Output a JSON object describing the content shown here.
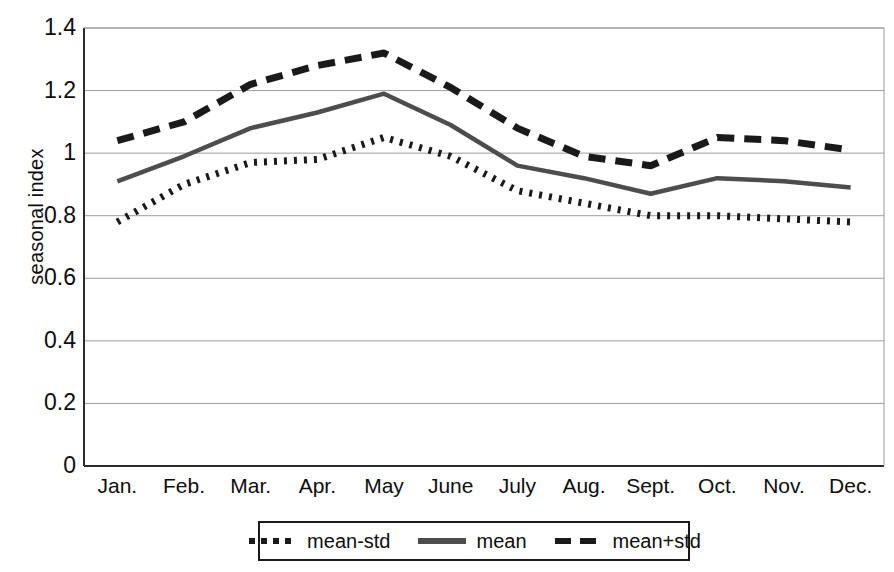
{
  "chart_data": {
    "type": "line",
    "title": "",
    "xlabel": "",
    "ylabel": "seasonal index",
    "categories": [
      "Jan.",
      "Feb.",
      "Mar.",
      "Apr.",
      "May",
      "June",
      "July",
      "Aug.",
      "Sept.",
      "Oct.",
      "Nov.",
      "Dec."
    ],
    "ylim": [
      0,
      1.4
    ],
    "yticks": [
      "0",
      "0.2",
      "0.4",
      "0.6",
      "0.8",
      "1",
      "1.2",
      "1.4"
    ],
    "ytick_values": [
      0,
      0.2,
      0.4,
      0.6,
      0.8,
      1.0,
      1.2,
      1.4
    ],
    "grid": true,
    "grid_axis": "y",
    "legend_position": "bottom",
    "series": [
      {
        "name": "mean-std",
        "style": "dotted",
        "color": "#1a1a1a",
        "values": [
          0.78,
          0.9,
          0.97,
          0.98,
          1.05,
          0.99,
          0.88,
          0.84,
          0.8,
          0.8,
          0.79,
          0.78
        ]
      },
      {
        "name": "mean",
        "style": "solid",
        "color": "#4d4d4d",
        "values": [
          0.91,
          0.99,
          1.08,
          1.13,
          1.19,
          1.09,
          0.96,
          0.92,
          0.87,
          0.92,
          0.91,
          0.89
        ]
      },
      {
        "name": "mean+std",
        "style": "dashed",
        "color": "#1a1a1a",
        "values": [
          1.04,
          1.1,
          1.22,
          1.28,
          1.32,
          1.21,
          1.08,
          0.99,
          0.96,
          1.05,
          1.04,
          1.01
        ]
      }
    ]
  },
  "legend": {
    "items": [
      {
        "label": "mean-std"
      },
      {
        "label": "mean"
      },
      {
        "label": "mean+std"
      }
    ]
  },
  "axes": {
    "y_axis_title": "seasonal index"
  }
}
